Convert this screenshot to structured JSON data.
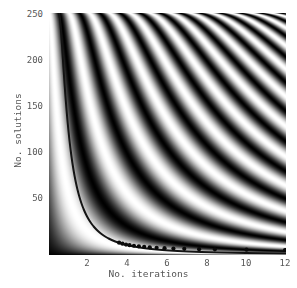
{
  "chart_data": {
    "type": "heatmap",
    "title": "",
    "xlabel": "No. iterations",
    "ylabel": "No. solutions",
    "xlim": [
      0,
      12
    ],
    "ylim": [
      0,
      256
    ],
    "xticks": [
      2,
      4,
      6,
      8,
      10,
      12
    ],
    "xtick_labels": [
      "2",
      "4",
      "6",
      "8",
      "10",
      "12"
    ],
    "yticks": [
      50,
      100,
      150,
      200,
      250
    ],
    "ytick_labels": [
      "50",
      "100",
      "150",
      "200",
      "250"
    ],
    "grid": false,
    "legend": "none",
    "colormap": "grayscale",
    "colormap_min_color": "#000000",
    "colormap_max_color": "#ffffff",
    "value_range": [
      0,
      1
    ],
    "value_description": "success probability",
    "cell_function": "sin((2*k+1)*asin(sqrt(m/N)))^2",
    "total_database_size": 256,
    "x_variable": "k",
    "y_variable": "m",
    "overlay_curve": {
      "name": "optimal iteration count",
      "color": "#141414",
      "line_width": 2.0,
      "function": "k = (pi/4)/asin(sqrt(m/256))",
      "points": [
        {
          "x": 0.79,
          "y": 256
        },
        {
          "x": 0.8,
          "y": 250
        },
        {
          "x": 0.83,
          "y": 235
        },
        {
          "x": 0.88,
          "y": 210
        },
        {
          "x": 0.93,
          "y": 186
        },
        {
          "x": 1.0,
          "y": 161
        },
        {
          "x": 1.1,
          "y": 135
        },
        {
          "x": 1.2,
          "y": 113
        },
        {
          "x": 1.3,
          "y": 98
        },
        {
          "x": 1.45,
          "y": 80
        },
        {
          "x": 1.6,
          "y": 66
        },
        {
          "x": 1.8,
          "y": 53
        },
        {
          "x": 2.0,
          "y": 43
        },
        {
          "x": 2.3,
          "y": 33
        },
        {
          "x": 2.6,
          "y": 26
        },
        {
          "x": 3.0,
          "y": 20
        },
        {
          "x": 3.5,
          "y": 15
        },
        {
          "x": 4.0,
          "y": 11
        },
        {
          "x": 4.5,
          "y": 9
        },
        {
          "x": 5.0,
          "y": 7.5
        },
        {
          "x": 5.6,
          "y": 6
        },
        {
          "x": 6.3,
          "y": 5
        },
        {
          "x": 7.0,
          "y": 4
        },
        {
          "x": 8.4,
          "y": 3
        },
        {
          "x": 10.0,
          "y": 2.1
        },
        {
          "x": 12.0,
          "y": 1.5
        }
      ]
    },
    "overlay_points": {
      "name": "integer optimal iterations",
      "color": "#0a0a0a",
      "marker": "circle",
      "marker_size": 3.0,
      "points": [
        {
          "x": 3.55,
          "y": 13
        },
        {
          "x": 3.72,
          "y": 12
        },
        {
          "x": 3.9,
          "y": 11
        },
        {
          "x": 4.08,
          "y": 10.4
        },
        {
          "x": 4.3,
          "y": 9.8
        },
        {
          "x": 4.55,
          "y": 9.2
        },
        {
          "x": 4.82,
          "y": 8.6
        },
        {
          "x": 5.1,
          "y": 8.1
        },
        {
          "x": 5.45,
          "y": 7.6
        },
        {
          "x": 5.85,
          "y": 7.2
        },
        {
          "x": 6.3,
          "y": 6.8
        },
        {
          "x": 6.85,
          "y": 6.5
        },
        {
          "x": 7.6,
          "y": 6.2
        },
        {
          "x": 8.4,
          "y": 6.0
        },
        {
          "x": 10.0,
          "y": 5.6
        },
        {
          "x": 11.95,
          "y": 5.3
        }
      ]
    }
  },
  "axes": {
    "x_label": "No. iterations",
    "y_label": "No. solutions",
    "x_tick_labels": [
      "2",
      "4",
      "6",
      "8",
      "10",
      "12"
    ],
    "y_tick_labels": [
      "50",
      "100",
      "150",
      "200",
      "250"
    ]
  }
}
